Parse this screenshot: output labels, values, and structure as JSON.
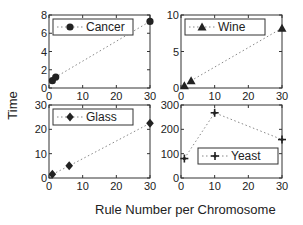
{
  "figure": {
    "ylabel": "Time",
    "xlabel": "Rule Number per Chromosome"
  },
  "chart_data": [
    {
      "type": "line",
      "title": "",
      "legend": "Cancer",
      "marker": "circle",
      "x": [
        1,
        2,
        30
      ],
      "y": [
        0.8,
        1.2,
        7.3
      ],
      "xlim": [
        0,
        30
      ],
      "ylim": [
        0,
        8
      ],
      "xticks": [
        0,
        10,
        20,
        30
      ],
      "yticks": [
        0,
        2,
        4,
        6,
        8
      ],
      "legend_position": "upper left"
    },
    {
      "type": "line",
      "title": "",
      "legend": "Wine",
      "marker": "triangle",
      "x": [
        1,
        3,
        30
      ],
      "y": [
        0.3,
        1.0,
        8.2
      ],
      "xlim": [
        0,
        30
      ],
      "ylim": [
        0,
        10
      ],
      "xticks": [
        0,
        10,
        20,
        30
      ],
      "yticks": [
        0,
        5,
        10
      ],
      "legend_position": "upper left"
    },
    {
      "type": "line",
      "title": "",
      "legend": "Glass",
      "marker": "diamond",
      "x": [
        1,
        6,
        30
      ],
      "y": [
        1.5,
        5,
        22.5
      ],
      "xlim": [
        0,
        30
      ],
      "ylim": [
        0,
        30
      ],
      "xticks": [
        0,
        10,
        20,
        30
      ],
      "yticks": [
        0,
        10,
        20,
        30
      ],
      "legend_position": "upper left"
    },
    {
      "type": "line",
      "title": "",
      "legend": "Yeast",
      "marker": "star",
      "x": [
        1,
        10,
        30
      ],
      "y": [
        80,
        268,
        158
      ],
      "xlim": [
        0,
        30
      ],
      "ylim": [
        0,
        300
      ],
      "xticks": [
        0,
        10,
        20,
        30
      ],
      "yticks": [
        0,
        100,
        200,
        300
      ],
      "legend_position": "lower right"
    }
  ]
}
